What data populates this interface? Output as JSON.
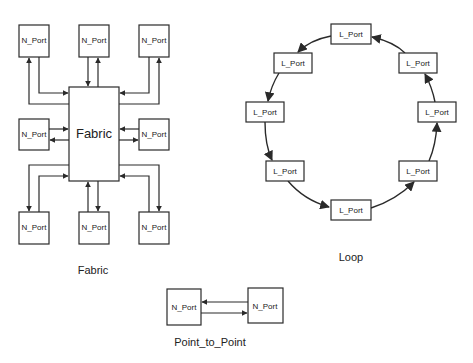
{
  "fabric": {
    "center_label": "Fabric",
    "caption": "Fabric",
    "ports": [
      {
        "label": "N_Port",
        "position": "top-left"
      },
      {
        "label": "N_Port",
        "position": "top-center"
      },
      {
        "label": "N_Port",
        "position": "top-right"
      },
      {
        "label": "N_Port",
        "position": "middle-left"
      },
      {
        "label": "N_Port",
        "position": "middle-right"
      },
      {
        "label": "N_Port",
        "position": "bottom-left"
      },
      {
        "label": "N_Port",
        "position": "bottom-center"
      },
      {
        "label": "N_Port",
        "position": "bottom-right"
      }
    ]
  },
  "loop": {
    "caption": "Loop",
    "ports": [
      {
        "label": "L_Port",
        "position": "top"
      },
      {
        "label": "L_Port",
        "position": "top-left"
      },
      {
        "label": "L_Port",
        "position": "left"
      },
      {
        "label": "L_Port",
        "position": "bottom-left"
      },
      {
        "label": "L_Port",
        "position": "bottom"
      },
      {
        "label": "L_Port",
        "position": "bottom-right"
      },
      {
        "label": "L_Port",
        "position": "right"
      },
      {
        "label": "L_Port",
        "position": "top-right"
      }
    ]
  },
  "point_to_point": {
    "caption": "Point_to_Point",
    "ports": [
      {
        "label": "N_Port",
        "position": "left"
      },
      {
        "label": "N_Port",
        "position": "right"
      }
    ]
  }
}
